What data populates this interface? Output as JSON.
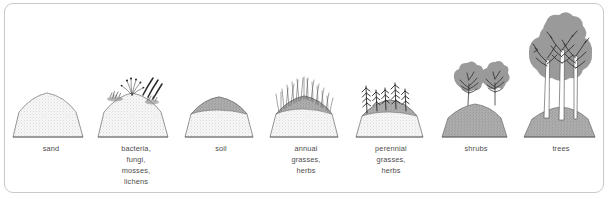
{
  "diagram": {
    "type": "ecological-succession-sequence",
    "border_color": "#c9c9c9",
    "background_color": "#ffffff",
    "text_color": "#4d4d4d",
    "sand_color": "#efefef",
    "soil_color": "#a8a8a8",
    "canopy_color": "#9a9a9a",
    "line_color": "#555555",
    "stages": [
      {
        "index": 1,
        "name": "sand",
        "label_lines": [
          "sand"
        ],
        "icon": "sand-mound-icon",
        "mound_height_px": 26,
        "vegetation": "none"
      },
      {
        "index": 2,
        "name": "bacteria-fungi-mosses-lichens",
        "label_lines": [
          "bacteria,",
          "fungi,",
          "mosses,",
          "lichens"
        ],
        "icon": "microbe-sprout-icon",
        "mound_height_px": 26,
        "vegetation": "filaments-and-moss-clumps"
      },
      {
        "index": 3,
        "name": "soil",
        "label_lines": [
          "soil"
        ],
        "icon": "soil-mound-icon",
        "mound_height_px": 30,
        "vegetation": "organic-layer"
      },
      {
        "index": 4,
        "name": "annual-grasses-herbs",
        "label_lines": [
          "annual",
          "grasses,",
          "herbs"
        ],
        "icon": "annual-grass-icon",
        "mound_height_px": 32,
        "vegetation": "fine-grass-blades"
      },
      {
        "index": 5,
        "name": "perennial-grasses-herbs",
        "label_lines": [
          "perennial",
          "grasses,",
          "herbs"
        ],
        "icon": "perennial-grass-icon",
        "mound_height_px": 30,
        "vegetation": "tall-stalks-with-leaflets"
      },
      {
        "index": 6,
        "name": "shrubs",
        "label_lines": [
          "shrubs"
        ],
        "icon": "shrub-icon",
        "mound_height_px": 26,
        "vegetation": "two-shrub-canopies"
      },
      {
        "index": 7,
        "name": "trees",
        "label_lines": [
          "trees"
        ],
        "icon": "tree-icon",
        "mound_height_px": 28,
        "vegetation": "three-trees-with-canopy"
      }
    ]
  }
}
